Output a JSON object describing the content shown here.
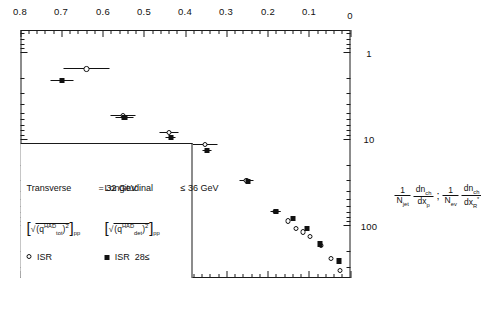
{
  "figure": {
    "kind": "scientific-scatter-plot",
    "orientation": "rotated-90-ccw",
    "background": "#ffffff",
    "ink": "#111111"
  },
  "axes": {
    "x": {
      "title_plain": "x_p , x_R*",
      "title_base1": "x",
      "title_sub1": "p",
      "title_sep": ",",
      "title_base2": "x",
      "title_sub2": "R",
      "title_sup2": "*",
      "min": 0,
      "max": 0.8,
      "tick_labels": [
        "0",
        "0.1",
        "0.2",
        "0.3",
        "0.4",
        "0.5",
        "0.6",
        "0.7",
        "0.8"
      ],
      "tick_values": [
        0,
        0.1,
        0.2,
        0.3,
        0.4,
        0.5,
        0.6,
        0.7,
        0.8
      ],
      "minor_per_major": 5,
      "scale": "linear"
    },
    "y": {
      "title_plain": "1/N_jet dn_ch/dx_p ; 1/N_ev dn_ch/dx_R*",
      "term1_pre": "1",
      "term1_pre_sub": "N",
      "term1_pre_subsub": "jet",
      "term1_num": "dn",
      "term1_num_sub": "ch",
      "term1_den": "dx",
      "term1_den_sub": "p",
      "separator": ";",
      "term2_pre_sub": "N",
      "term2_pre_subsub": "ev",
      "term2_num": "dn",
      "term2_num_sub": "ch",
      "term2_den": "dx",
      "term2_den_sub": "R",
      "term2_den_sup": "*",
      "scale": "log",
      "min": 0.55,
      "max": 400,
      "tick_labels": [
        "100",
        "10",
        "1"
      ],
      "tick_values": [
        100,
        10,
        1
      ]
    }
  },
  "legend": {
    "border": true,
    "entries": [
      {
        "marker": "open-circle",
        "label": "ISR",
        "bracket_open": "[",
        "radical": "√",
        "q_sym": "q",
        "q_sup": "HAD",
        "q_sub": "tot",
        "q_pow": "2",
        "bracket_close": "]",
        "subscript_pp": "pp",
        "kinematics_name": "Transverse",
        "relation": "= 32  GeV"
      },
      {
        "marker": "filled-square",
        "label": "ISR",
        "prefix": "28",
        "prefix_rel": "≤",
        "bracket_open": "[",
        "radical": "√",
        "q_sym": "q",
        "q_sup": "HAD",
        "q_sub": "det",
        "q_pow": "2",
        "bracket_close": "]",
        "subscript_pp": "pp",
        "kinematics_name": "Longitudinal",
        "relation": "≤ 36  GeV"
      }
    ]
  },
  "chart_data": {
    "type": "scatter",
    "title": "",
    "xlabel": "x_p , x_R*",
    "ylabel": "1/N_jet dn_ch/dx_p ; 1/N_ev dn_ch/dx_R*",
    "xlim": [
      0,
      0.8
    ],
    "ylim": [
      0.55,
      400
    ],
    "yscale": "log",
    "grid": false,
    "legend_position": "top-left",
    "series": [
      {
        "name": "ISR",
        "marker": "open-circle",
        "points": [
          {
            "x": 0.025,
            "y": 330,
            "xerr": 0.0
          },
          {
            "x": 0.048,
            "y": 240,
            "xerr": 0.0
          },
          {
            "x": 0.072,
            "y": 170,
            "xerr": 0.0
          },
          {
            "x": 0.098,
            "y": 132,
            "xerr": 0.0
          },
          {
            "x": 0.115,
            "y": 118,
            "xerr": 0.0
          },
          {
            "x": 0.132,
            "y": 108,
            "xerr": 0.0
          },
          {
            "x": 0.152,
            "y": 88,
            "xerr": 0.0
          },
          {
            "x": 0.182,
            "y": 68,
            "xerr": 0.012
          },
          {
            "x": 0.252,
            "y": 30,
            "xerr": 0.016
          },
          {
            "x": 0.352,
            "y": 11.5,
            "xerr": 0.03
          },
          {
            "x": 0.44,
            "y": 8.4,
            "xerr": 0.022
          },
          {
            "x": 0.552,
            "y": 5.3,
            "xerr": 0.03
          },
          {
            "x": 0.64,
            "y": 1.55,
            "xerr": 0.055
          }
        ]
      },
      {
        "name": "ISR 28≤",
        "marker": "filled-square",
        "points": [
          {
            "x": 0.028,
            "y": 255,
            "xerr": 0.0
          },
          {
            "x": 0.073,
            "y": 162,
            "xerr": 0.0
          },
          {
            "x": 0.105,
            "y": 108,
            "xerr": 0.0
          },
          {
            "x": 0.14,
            "y": 83,
            "xerr": 0.0
          },
          {
            "x": 0.18,
            "y": 68,
            "xerr": 0.01
          },
          {
            "x": 0.248,
            "y": 31,
            "xerr": 0.0
          },
          {
            "x": 0.348,
            "y": 13.5,
            "xerr": 0.012
          },
          {
            "x": 0.436,
            "y": 9.6,
            "xerr": 0.012
          },
          {
            "x": 0.548,
            "y": 5.6,
            "xerr": 0.022
          },
          {
            "x": 0.7,
            "y": 2.1,
            "xerr": 0.028
          }
        ]
      }
    ]
  }
}
